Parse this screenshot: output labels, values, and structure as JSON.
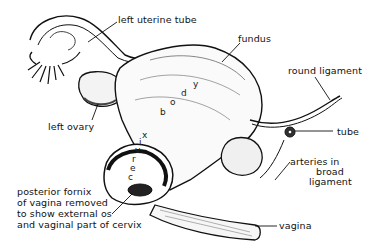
{
  "figure": {
    "type": "anatomical line drawing",
    "colors": {
      "ink": "#111111",
      "background": "#ffffff",
      "shade": "#555555"
    }
  },
  "labels": {
    "left_uterine_tube": "left uterine tube",
    "fundus": "fundus",
    "round_ligament": "round ligament",
    "left_ovary": "left ovary",
    "tube": "tube",
    "arteries_line1": "arteries in",
    "arteries_line2": "broad",
    "arteries_line3": "ligament",
    "posterior_line1": "posterior fornix",
    "posterior_line2": "of vagina removed",
    "posterior_line3": "to show external os",
    "posterior_line4": "and vaginal part of cervix",
    "vagina": "vagina"
  },
  "organ_text": {
    "body_letters": [
      "b",
      "o",
      "d",
      "y"
    ],
    "cervix_letters": [
      "c",
      "e",
      "r",
      "v",
      "i",
      "x"
    ]
  }
}
